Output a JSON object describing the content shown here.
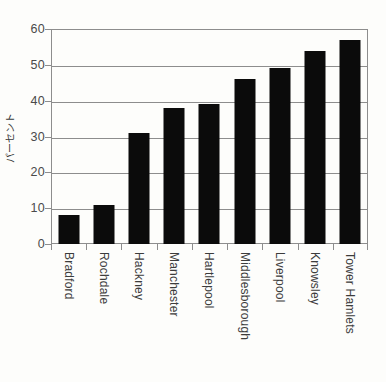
{
  "chart_data": {
    "type": "bar",
    "title": "",
    "subtitle": "",
    "xlabel": "",
    "ylabel": "パーセント",
    "ylim": [
      0,
      60
    ],
    "ytick_step": 10,
    "ytick_labels": [
      "0",
      "10",
      "20",
      "30",
      "40",
      "50",
      "60"
    ],
    "grid": true,
    "legend": "none",
    "bar_color": "#0b0b0b",
    "axis_color": "#8d8d8d",
    "categories": [
      "Bradford",
      "Rochdale",
      "Hackney",
      "Manchester",
      "Hartlepool",
      "Middlesborough",
      "Liverpool",
      "Knowsley",
      "Tower Hamlets"
    ],
    "values": [
      8,
      11,
      31,
      38,
      39,
      46,
      49,
      54,
      57
    ]
  }
}
